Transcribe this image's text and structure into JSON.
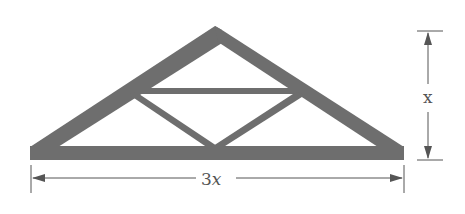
{
  "figure": {
    "type": "roof-truss",
    "colors": {
      "member": "#6e6e6e",
      "dimension": "#555555",
      "background": "#ffffff"
    },
    "labels": {
      "width_label": "3x",
      "width_coef": "3",
      "width_var": "x",
      "height_label": "x"
    },
    "members": [
      "left-rafter",
      "right-rafter",
      "bottom-chord",
      "horizontal-collar-tie",
      "left-diagonal-web",
      "right-diagonal-web"
    ]
  }
}
